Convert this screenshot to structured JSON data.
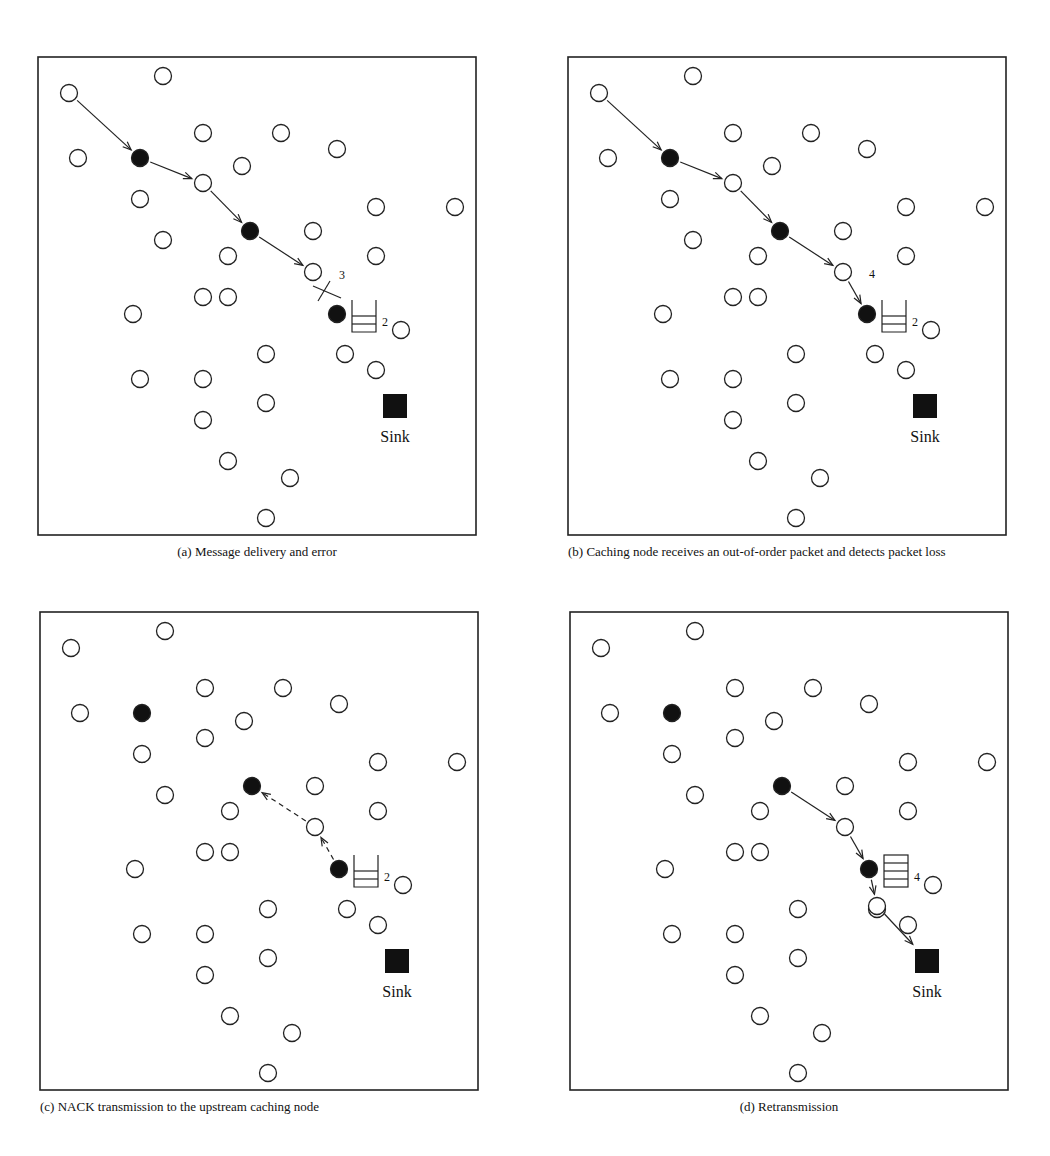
{
  "figure": {
    "panels": [
      {
        "id": "a",
        "caption": "(a)  Message delivery and error",
        "box": {
          "x": 38,
          "y": 57,
          "w": 438,
          "h": 478
        },
        "cache_label": "2",
        "seq_label": "3",
        "queue_slots": 3
      },
      {
        "id": "b",
        "caption": "(b)  Caching node receives an out-of-order packet and detects packet loss",
        "box": {
          "x": 568,
          "y": 57,
          "w": 438,
          "h": 478
        },
        "cache_label": "2",
        "seq_label": "4",
        "queue_slots": 3
      },
      {
        "id": "c",
        "caption": "(c)  NACK transmission to the upstream caching node",
        "box": {
          "x": 40,
          "y": 612,
          "w": 438,
          "h": 478
        },
        "cache_label": "2",
        "queue_slots": 3
      },
      {
        "id": "d",
        "caption": "(d)  Retransmission",
        "box": {
          "x": 570,
          "y": 612,
          "w": 438,
          "h": 478
        },
        "cache_label": "4",
        "queue_slots": 4
      }
    ],
    "sink_label": "Sink",
    "legend": {
      "open_circle": "sensor node",
      "filled_circle": "caching node",
      "filled_square": "sink"
    }
  },
  "nodes_relative": [
    [
      31,
      36
    ],
    [
      125,
      19
    ],
    [
      40,
      101
    ],
    [
      102,
      101,
      "cache"
    ],
    [
      165,
      76
    ],
    [
      243,
      76
    ],
    [
      299,
      92
    ],
    [
      204,
      109
    ],
    [
      165,
      126
    ],
    [
      102,
      142
    ],
    [
      338,
      150
    ],
    [
      417,
      150
    ],
    [
      212,
      174,
      "cache"
    ],
    [
      125,
      183
    ],
    [
      275,
      174
    ],
    [
      190,
      199
    ],
    [
      338,
      199
    ],
    [
      275,
      215
    ],
    [
      165,
      240
    ],
    [
      190,
      240
    ],
    [
      95,
      257
    ],
    [
      299,
      257,
      "cache"
    ],
    [
      363,
      273
    ],
    [
      228,
      297
    ],
    [
      307,
      297
    ],
    [
      338,
      313
    ],
    [
      102,
      322
    ],
    [
      165,
      322
    ],
    [
      228,
      346
    ],
    [
      165,
      363
    ],
    [
      190,
      404
    ],
    [
      252,
      421
    ],
    [
      228,
      461
    ]
  ],
  "sink_relative": [
    357,
    349
  ]
}
